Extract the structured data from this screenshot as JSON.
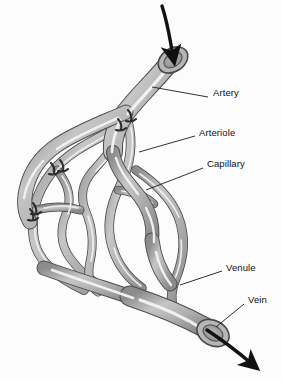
{
  "figure": {
    "background_color": "#fcfcfc",
    "vessel_fill": "#a8a8a8",
    "vessel_outline": "#4a4a4a",
    "vessel_highlight": "#f2f2f2",
    "lumen_color": "#9a9a9a",
    "sphincter_color": "#2b2b2b",
    "arrow_color": "#111111",
    "leader_color": "#1a1a1a",
    "label_color": "#111111"
  },
  "labels": [
    {
      "id": "artery",
      "text": "Artery",
      "x": 213,
      "y": 93
    },
    {
      "id": "arteriole",
      "text": "Arteriole",
      "x": 199,
      "y": 133
    },
    {
      "id": "capillary",
      "text": "Capillary",
      "x": 207,
      "y": 164
    },
    {
      "id": "venule",
      "text": "Venule",
      "x": 226,
      "y": 268
    },
    {
      "id": "vein",
      "text": "Vein",
      "x": 248,
      "y": 300
    }
  ],
  "leader_lines": [
    {
      "id": "artery-leader",
      "x1": 152,
      "y1": 87,
      "x2": 208,
      "y2": 97
    },
    {
      "id": "arteriole-leader",
      "x1": 139,
      "y1": 152,
      "x2": 195,
      "y2": 136
    },
    {
      "id": "capillary-leader",
      "x1": 146,
      "y1": 190,
      "x2": 203,
      "y2": 168
    },
    {
      "id": "venule-leader",
      "x1": 180,
      "y1": 285,
      "x2": 222,
      "y2": 271
    },
    {
      "id": "vein-leader",
      "x1": 216,
      "y1": 327,
      "x2": 244,
      "y2": 304
    }
  ],
  "flow_arrows": [
    {
      "id": "artery-inflow-arrow",
      "direction": "into-artery",
      "description": "blood enters the artery"
    },
    {
      "id": "vein-outflow-arrow",
      "direction": "out-of-vein",
      "description": "blood exits the vein"
    }
  ],
  "sphincters": [
    {
      "id": "sphincter-1",
      "x": 131,
      "y": 115
    },
    {
      "id": "sphincter-2",
      "x": 121,
      "y": 124
    },
    {
      "id": "sphincter-3",
      "x": 63,
      "y": 165
    },
    {
      "id": "sphincter-4",
      "x": 54,
      "y": 168
    },
    {
      "id": "sphincter-5",
      "x": 36,
      "y": 208
    },
    {
      "id": "sphincter-6",
      "x": 33,
      "y": 213
    }
  ],
  "bottom_cropped_text": ""
}
